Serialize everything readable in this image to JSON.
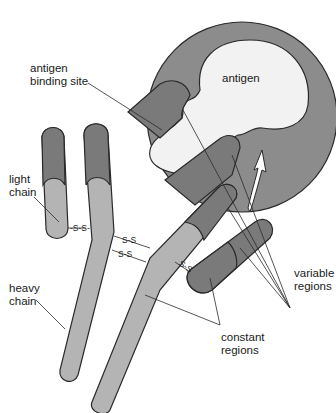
{
  "diagram": {
    "labels": {
      "antigen": "antigen",
      "antigen_binding_site_line1": "antigen",
      "antigen_binding_site_line2": "binding site",
      "light_chain_line1": "light",
      "light_chain_line2": "chain",
      "heavy_chain_line1": "heavy",
      "heavy_chain_line2": "chain",
      "variable_regions_line1": "variable",
      "variable_regions_line2": "regions",
      "constant_regions_line1": "constant",
      "constant_regions_line2": "regions"
    },
    "disulfide_bonds": [
      "-S-S-",
      "S-S",
      "S-S",
      "S-S"
    ],
    "colors": {
      "circle_fill": "#8c8c8c",
      "antigen_fill": "#f2f2f2",
      "variable_fill": "#7a7a7a",
      "constant_fill": "#b4b4b4",
      "outline": "#2a2a2a",
      "background": "#ffffff"
    }
  }
}
